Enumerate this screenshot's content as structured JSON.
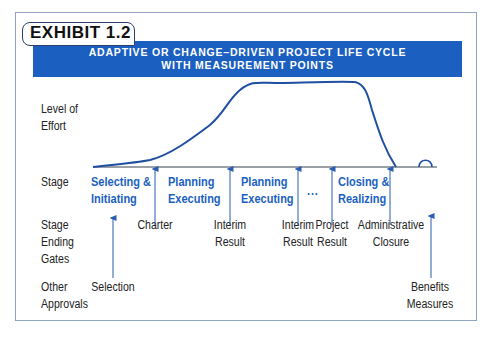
{
  "exhibit": {
    "label": "EXHIBIT 1.2",
    "title_line1": "ADAPTIVE OR CHANGE–DRIVEN PROJECT LIFE CYCLE",
    "title_line2": "WITH MEASUREMENT POINTS"
  },
  "row_labels": {
    "effort_line1": "Level of",
    "effort_line2": "Effort",
    "stage": "Stage",
    "gates_line1": "Stage",
    "gates_line2": "Ending",
    "gates_line3": "Gates",
    "approvals_line1": "Other",
    "approvals_line2": "Approvals"
  },
  "stages": [
    {
      "line1": "Selecting &",
      "line2": "Initiating"
    },
    {
      "line1": "Planning",
      "line2": "Executing"
    },
    {
      "line1": "Planning",
      "line2": "Executing"
    },
    {
      "line1": "...",
      "line2": ""
    },
    {
      "line1": "Closing &",
      "line2": "Realizing"
    }
  ],
  "gates": [
    {
      "line1": "Charter",
      "line2": ""
    },
    {
      "line1": "Interim",
      "line2": "Result"
    },
    {
      "line1": "Interim",
      "line2": "Result"
    },
    {
      "line1": "Project",
      "line2": "Result"
    },
    {
      "line1": "Administrative",
      "line2": "Closure"
    }
  ],
  "approvals": [
    {
      "line1": "Selection",
      "line2": ""
    },
    {
      "line1": "Benefits",
      "line2": "Measures"
    }
  ],
  "colors": {
    "accent_blue": "#1b5fc0",
    "curve_blue": "#1e4fa0",
    "frame_border": "#8fa3c4",
    "text": "#222222"
  }
}
